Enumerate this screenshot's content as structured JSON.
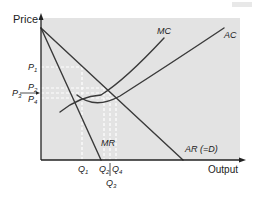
{
  "diagram": {
    "type": "economics-cost-revenue",
    "axes": {
      "y_label": "Price",
      "x_label": "Output"
    },
    "curves": {
      "mc": "MC",
      "ac": "AC",
      "mr": "MR",
      "ar": "AR (=D)"
    },
    "price_levels": {
      "p1": "P",
      "p1_sub": "1",
      "p2": "P",
      "p2_sub": "2",
      "p3": "P",
      "p3_sub": "3",
      "p4": "P",
      "p4_sub": "4"
    },
    "quantity_levels": {
      "q1": "Q",
      "q1_sub": "1",
      "q2": "Q",
      "q2_sub": "2",
      "q3": "Q",
      "q3_sub": "3",
      "q4": "Q",
      "q4_sub": "4"
    },
    "colors": {
      "plot_background": "#e3e3e3",
      "curve": "#3a3a3a",
      "guide": "#ffffff",
      "text": "#222222"
    }
  }
}
